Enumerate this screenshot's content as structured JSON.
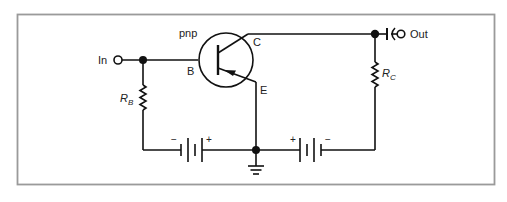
{
  "diagram": {
    "type": "circuit-schematic",
    "frame_color": "#9a9a9a",
    "wire_color": "#111111",
    "transistor": {
      "type_label": "pnp",
      "base_label": "B",
      "collector_label": "C",
      "emitter_label": "E"
    },
    "input": {
      "label": "In"
    },
    "output": {
      "label": "Out"
    },
    "resistors": [
      {
        "id": "rb",
        "label_main": "R",
        "label_sub": "B"
      },
      {
        "id": "rc",
        "label_main": "R",
        "label_sub": "C"
      }
    ],
    "batteries": [
      {
        "id": "base-battery",
        "left_sign": "−",
        "right_sign": "+"
      },
      {
        "id": "collector-battery",
        "left_sign": "+",
        "right_sign": "−"
      }
    ],
    "ground": {
      "symbol": "ground"
    }
  }
}
